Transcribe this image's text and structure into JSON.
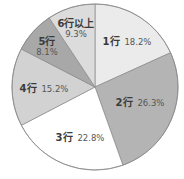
{
  "chart_data": {
    "type": "pie",
    "title": "",
    "start_angle_deg": 0,
    "direction": "clockwise",
    "center": [
      95,
      87
    ],
    "radius": 83,
    "slices": [
      {
        "label": "1行",
        "value": 18.2,
        "value_label": "18.2%",
        "color": "#ebebeb",
        "label_pos": [
          127,
          42
        ],
        "stacked": false
      },
      {
        "label": "2行",
        "value": 26.3,
        "value_label": "26.3%",
        "color": "#b4b4b4",
        "label_pos": [
          140,
          103
        ],
        "stacked": false
      },
      {
        "label": "3行",
        "value": 22.8,
        "value_label": "22.8%",
        "color": "#ffffff",
        "label_pos": [
          80,
          138
        ],
        "stacked": false
      },
      {
        "label": "4行",
        "value": 15.2,
        "value_label": "15.2%",
        "color": "#d2d2d2",
        "label_pos": [
          44,
          89
        ],
        "stacked": false
      },
      {
        "label": "5行",
        "value": 8.1,
        "value_label": "8.1%",
        "color": "#a8a8a8",
        "label_pos": [
          47,
          47
        ],
        "stacked": true
      },
      {
        "label": "6行以上",
        "value": 9.3,
        "value_label": "9.3%",
        "color": "#dcdcdc",
        "label_pos": [
          76,
          29
        ],
        "stacked": true
      }
    ],
    "legend": null,
    "grid": false
  }
}
